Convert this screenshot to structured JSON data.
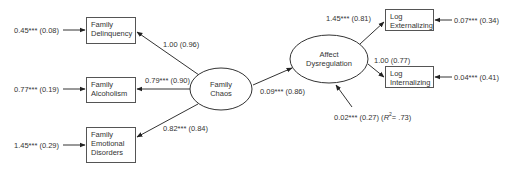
{
  "diagram": {
    "type": "structural-equation-path-diagram",
    "latent": {
      "family_chaos": {
        "line1": "Family",
        "line2": "Chaos"
      },
      "affect_dysregulation": {
        "line1": "Affect",
        "line2": "Dysregulation"
      }
    },
    "observed": {
      "family_delinquency": {
        "line1": "Family",
        "line2": "Delinquency"
      },
      "family_alcoholism": {
        "line1": "Family",
        "line2": "Alcoholism"
      },
      "family_emotional_disorders": {
        "line1": "Family",
        "line2": "Emotional",
        "line3": "Disorders"
      },
      "log_externalizing": {
        "line1": "Log",
        "line2": "Externalizing"
      },
      "log_internalizing": {
        "line1": "Log",
        "line2": "Internalizing"
      }
    },
    "error_variances": {
      "family_delinquency": "0.45*** (0.08)",
      "family_alcoholism": "0.77*** (0.19)",
      "family_emotional_disorders": "1.45*** (0.29)",
      "log_externalizing": "0.07*** (0.34)",
      "log_internalizing": "0.04*** (0.41)"
    },
    "loadings": {
      "chaos_to_delinquency": "1.00 (0.96)",
      "chaos_to_alcoholism": "0.79*** (0.90)",
      "chaos_to_emotional": "0.82*** (0.84)",
      "dysregulation_to_externalizing": "1.45*** (0.81)",
      "dysregulation_to_internalizing": "1.00 (0.77)"
    },
    "structural_paths": {
      "chaos_to_dysregulation": "0.09*** (0.86)"
    },
    "disturbance": {
      "affect_dysregulation_prefix": "0.02*** (0.27) (",
      "r_symbol": "R",
      "r_sup": "2",
      "r_value": "= .73)"
    }
  }
}
